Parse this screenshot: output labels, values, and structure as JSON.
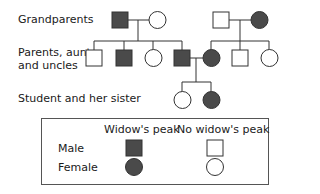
{
  "diagram": {
    "type": "pedigree",
    "colors": {
      "affected": "#4a4a4a",
      "unaffected": "#ffffff",
      "stroke": "#333333"
    },
    "generation_labels": {
      "grandparents": "Grandparents",
      "parents_line1": "Parents, aunts,",
      "parents_line2": "and uncles",
      "children": "Student and her sister"
    },
    "generations": [
      {
        "name": "Grandparents",
        "individuals": [
          {
            "id": "pgf",
            "sex": "male",
            "widows_peak": true
          },
          {
            "id": "pgm",
            "sex": "female",
            "widows_peak": false
          },
          {
            "id": "mgf",
            "sex": "male",
            "widows_peak": false
          },
          {
            "id": "mgm",
            "sex": "female",
            "widows_peak": true
          }
        ]
      },
      {
        "name": "Parents, aunts, and uncles",
        "individuals": [
          {
            "id": "uncle1",
            "sex": "male",
            "widows_peak": false
          },
          {
            "id": "uncle2",
            "sex": "male",
            "widows_peak": true
          },
          {
            "id": "aunt1",
            "sex": "female",
            "widows_peak": false
          },
          {
            "id": "father",
            "sex": "male",
            "widows_peak": true
          },
          {
            "id": "mother",
            "sex": "female",
            "widows_peak": true
          },
          {
            "id": "uncle3",
            "sex": "male",
            "widows_peak": false
          },
          {
            "id": "aunt2",
            "sex": "female",
            "widows_peak": false
          }
        ]
      },
      {
        "name": "Student and her sister",
        "individuals": [
          {
            "id": "student",
            "sex": "female",
            "widows_peak": false
          },
          {
            "id": "sister",
            "sex": "female",
            "widows_peak": true
          }
        ]
      }
    ]
  },
  "legend": {
    "col_widows_peak": "Widow's peak",
    "col_no_widows_peak": "No widow's peak",
    "row_male": "Male",
    "row_female": "Female"
  }
}
